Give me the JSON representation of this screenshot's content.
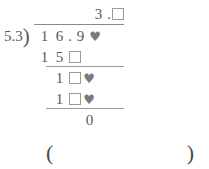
{
  "problem": {
    "type": "long-division",
    "divisor": "5.3",
    "bracket_glyph": ")",
    "decimal_point": ".",
    "heart_glyph": "♥",
    "quotient": {
      "label": "quotient",
      "digits": [
        "3"
      ],
      "decimal_point": ".",
      "trailing": [
        {
          "kind": "box",
          "value": ""
        }
      ]
    },
    "dividend": {
      "label": "dividend",
      "cells": [
        {
          "kind": "digit",
          "value": "1"
        },
        {
          "kind": "digit",
          "value": "6"
        },
        {
          "kind": "point",
          "value": "."
        },
        {
          "kind": "digit",
          "value": "9"
        },
        {
          "kind": "heart",
          "value": "♥"
        }
      ]
    },
    "work_rows": [
      {
        "name": "subtract-row-1",
        "cells": [
          {
            "kind": "digit",
            "value": "1"
          },
          {
            "kind": "digit",
            "value": "5"
          },
          {
            "kind": "box",
            "value": ""
          },
          {
            "kind": "blank",
            "value": ""
          }
        ]
      },
      {
        "name": "bring-down-row-1",
        "cells": [
          {
            "kind": "blank",
            "value": ""
          },
          {
            "kind": "digit",
            "value": "1"
          },
          {
            "kind": "box",
            "value": ""
          },
          {
            "kind": "heart",
            "value": "♥"
          }
        ]
      },
      {
        "name": "subtract-row-2",
        "cells": [
          {
            "kind": "blank",
            "value": ""
          },
          {
            "kind": "digit",
            "value": "1"
          },
          {
            "kind": "box",
            "value": ""
          },
          {
            "kind": "heart",
            "value": "♥"
          }
        ]
      },
      {
        "name": "remainder-row",
        "cells": [
          {
            "kind": "blank",
            "value": ""
          },
          {
            "kind": "blank",
            "value": ""
          },
          {
            "kind": "blank",
            "value": ""
          },
          {
            "kind": "digit",
            "value": "0"
          }
        ]
      }
    ]
  },
  "answer_blank": {
    "open_paren": "(",
    "close_paren": ")",
    "value": ""
  },
  "colors": {
    "ink": "#595959",
    "rule": "#9a9a9a",
    "box_border": "#9a9a9a",
    "heart": "#7a7a7a",
    "background": "#ffffff"
  }
}
